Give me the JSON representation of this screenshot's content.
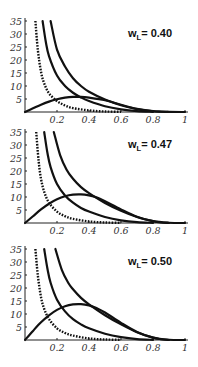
{
  "figure": {
    "tick_label_y": [
      "5",
      "10",
      "15",
      "20",
      "25",
      "30",
      "35"
    ],
    "tick_label_x": [
      "0.2",
      "0.4",
      "0.6",
      "0.8",
      "1"
    ],
    "colors": {
      "curve": "#111111",
      "axis": "#222222",
      "text": "#333333"
    }
  },
  "chart_data": [
    {
      "type": "line",
      "title": "w_L = 0.40",
      "label_main": "w",
      "label_sub": "L",
      "label_value": "= 0.40",
      "xlabel": "",
      "ylabel": "",
      "xlim": [
        0,
        1
      ],
      "ylim": [
        0,
        35
      ],
      "xticks": [
        0.2,
        0.4,
        0.6,
        0.8,
        1
      ],
      "yticks": [
        5,
        10,
        15,
        20,
        25,
        30,
        35
      ],
      "grid": false,
      "legend": null,
      "series": [
        {
          "name": "dashed",
          "style": "dashed",
          "x": [
            0.065,
            0.08,
            0.1,
            0.12,
            0.15,
            0.2,
            0.25,
            0.3,
            0.4,
            0.5,
            0.6
          ],
          "y": [
            35,
            24,
            15.5,
            11,
            7.2,
            4.2,
            2.5,
            1.5,
            0.6,
            0.2,
            0.05
          ]
        },
        {
          "name": "solid-A",
          "style": "solid",
          "x": [
            0.11,
            0.13,
            0.15,
            0.2,
            0.25,
            0.3,
            0.35,
            0.4,
            0.5,
            0.6,
            0.7,
            0.8
          ],
          "y": [
            35,
            27,
            21.5,
            14,
            10,
            7.4,
            5.6,
            4.2,
            2.2,
            1,
            0.3,
            0.05
          ]
        },
        {
          "name": "solid-B",
          "style": "solid",
          "x": [
            0.16,
            0.2,
            0.25,
            0.3,
            0.35,
            0.4,
            0.5,
            0.6,
            0.7,
            0.8,
            0.85,
            0.9
          ],
          "y": [
            35,
            24,
            17.5,
            13,
            10,
            7.8,
            4.8,
            2.6,
            1.1,
            0.3,
            0.1,
            0
          ]
        },
        {
          "name": "hump",
          "style": "solid",
          "x": [
            0,
            0.05,
            0.1,
            0.15,
            0.2,
            0.25,
            0.3,
            0.35,
            0.4,
            0.5,
            0.6,
            0.7,
            0.8,
            0.9,
            1
          ],
          "y": [
            0,
            1.4,
            2.8,
            4,
            4.9,
            5.5,
            5.8,
            5.8,
            5.5,
            4.5,
            2.8,
            1.2,
            0.3,
            0.05,
            0
          ]
        }
      ]
    },
    {
      "type": "line",
      "title": "w_L = 0.47",
      "label_main": "w",
      "label_sub": "L",
      "label_value": "= 0.47",
      "xlabel": "",
      "ylabel": "",
      "xlim": [
        0,
        1
      ],
      "ylim": [
        0,
        35
      ],
      "xticks": [
        0.2,
        0.4,
        0.6,
        0.8,
        1
      ],
      "yticks": [
        5,
        10,
        15,
        20,
        25,
        30,
        35
      ],
      "grid": false,
      "legend": null,
      "series": [
        {
          "name": "dashed",
          "style": "dashed",
          "x": [
            0.07,
            0.085,
            0.1,
            0.12,
            0.15,
            0.2,
            0.25,
            0.3,
            0.4,
            0.5,
            0.6
          ],
          "y": [
            35,
            24,
            17,
            12,
            7.8,
            4.4,
            2.6,
            1.6,
            0.6,
            0.2,
            0.05
          ]
        },
        {
          "name": "solid-A",
          "style": "solid",
          "x": [
            0.12,
            0.14,
            0.16,
            0.2,
            0.25,
            0.3,
            0.35,
            0.4,
            0.5,
            0.6,
            0.7,
            0.8
          ],
          "y": [
            35,
            27,
            21.5,
            15,
            10.6,
            7.8,
            5.8,
            4.4,
            2.3,
            1,
            0.3,
            0.05
          ]
        },
        {
          "name": "solid-B",
          "style": "solid",
          "x": [
            0.18,
            0.22,
            0.26,
            0.3,
            0.35,
            0.4,
            0.5,
            0.6,
            0.7,
            0.8,
            0.85,
            0.9
          ],
          "y": [
            35,
            26,
            20.5,
            17,
            13.8,
            11.5,
            7.7,
            4.7,
            2.3,
            0.7,
            0.2,
            0
          ]
        },
        {
          "name": "hump",
          "style": "solid",
          "x": [
            0,
            0.05,
            0.1,
            0.15,
            0.2,
            0.25,
            0.3,
            0.35,
            0.4,
            0.45,
            0.5,
            0.6,
            0.7,
            0.8,
            0.9,
            1
          ],
          "y": [
            0,
            2.6,
            5.2,
            7.4,
            9.1,
            10.3,
            10.9,
            11,
            10.6,
            9.8,
            8.4,
            5.2,
            2.4,
            0.7,
            0.1,
            0
          ]
        }
      ]
    },
    {
      "type": "line",
      "title": "w_L = 0.50",
      "label_main": "w",
      "label_sub": "L",
      "label_value": "= 0.50",
      "xlabel": "",
      "ylabel": "",
      "xlim": [
        0,
        1
      ],
      "ylim": [
        0,
        35
      ],
      "xticks": [
        0.2,
        0.4,
        0.6,
        0.8,
        1
      ],
      "yticks": [
        5,
        10,
        15,
        20,
        25,
        30,
        35
      ],
      "grid": false,
      "legend": null,
      "series": [
        {
          "name": "dashed",
          "style": "dashed",
          "x": [
            0.065,
            0.08,
            0.1,
            0.12,
            0.15,
            0.2,
            0.25,
            0.3,
            0.4,
            0.5,
            0.6
          ],
          "y": [
            35,
            25,
            16.5,
            12,
            8,
            4.5,
            2.7,
            1.7,
            0.6,
            0.2,
            0.05
          ]
        },
        {
          "name": "solid-A",
          "style": "solid",
          "x": [
            0.12,
            0.14,
            0.16,
            0.2,
            0.25,
            0.3,
            0.35,
            0.4,
            0.5,
            0.6,
            0.7,
            0.8
          ],
          "y": [
            35,
            27.5,
            22,
            15.5,
            11,
            8,
            6,
            4.5,
            2.4,
            1.1,
            0.35,
            0.05
          ]
        },
        {
          "name": "solid-B",
          "style": "solid",
          "x": [
            0.19,
            0.23,
            0.27,
            0.3,
            0.35,
            0.4,
            0.5,
            0.6,
            0.7,
            0.8,
            0.85,
            0.9
          ],
          "y": [
            35,
            27,
            22,
            19.5,
            16.2,
            13.7,
            9.5,
            6,
            3,
            0.9,
            0.3,
            0
          ]
        },
        {
          "name": "hump",
          "style": "solid",
          "x": [
            0,
            0.05,
            0.1,
            0.15,
            0.2,
            0.25,
            0.3,
            0.35,
            0.4,
            0.45,
            0.5,
            0.6,
            0.7,
            0.8,
            0.9,
            1
          ],
          "y": [
            0,
            3.5,
            6.8,
            9.5,
            11.6,
            13,
            13.7,
            13.8,
            13.3,
            12.2,
            10.6,
            6.6,
            3.1,
            0.9,
            0.1,
            0
          ]
        }
      ]
    }
  ]
}
